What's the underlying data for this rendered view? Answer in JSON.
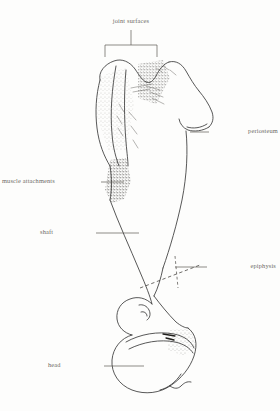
{
  "figure": {
    "kind": "anatomical-line-drawing",
    "background_color": "#fdfdfc",
    "ink_color": "#3a3a3a",
    "label_color": "#6e6b66",
    "leader_color": "#5c5954"
  },
  "labels": {
    "joint_surfaces": "joint surfaces",
    "periosteum": "periosteum",
    "muscle_attachments": "muscle attachments",
    "shaft": "shaft",
    "epiphysis": "epiphysis",
    "head": "head"
  }
}
